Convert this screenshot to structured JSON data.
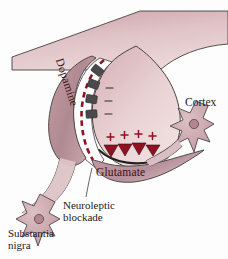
{
  "figure": {
    "background_color": "#ffffff"
  },
  "labels": {
    "dopamine": "Dopamine",
    "glutamate": "Glutamate",
    "cortex": "Cortex",
    "neuroleptic_blockade": "Neuroleptic\nblockade",
    "substantia_nigra": "Substantia\nnigra"
  },
  "symbols": {
    "excitatory_signs": [
      "+",
      "+",
      "+",
      "+"
    ],
    "inhibitory_signs": [
      "–",
      "–",
      "–"
    ],
    "vesicle_count": 4,
    "receptor_block_count": 4
  },
  "colors": {
    "membrane_light": "#e7cfd2",
    "membrane_mid": "#d8b7bd",
    "terminal_dark": "#b98f96",
    "outline": "#3f3a3c",
    "blockade_red": "#8e1220",
    "vesicle_red": "#8e1220",
    "receptor_gray": "#4a4a4c",
    "text": "#242024",
    "background": "#ffffff"
  },
  "structures": {
    "postsynaptic_cell": "postsynaptic-neuron-body",
    "dopamine_terminal": "dopamine-axon-terminal",
    "glutamate_terminal": "glutamate-axon-terminal",
    "cortex_neuron": "cortex-pyramidal-neuron",
    "substantia_nigra_neuron": "substantia-nigra-neuron",
    "synaptic_cleft": "synaptic-cleft",
    "blockade_line": "neuroleptic-blockade-dashed-line"
  }
}
